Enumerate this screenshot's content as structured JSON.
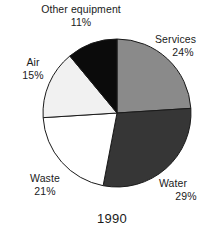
{
  "chart_data": {
    "type": "pie",
    "title": "1990",
    "xlabel": "",
    "ylabel": "",
    "legend_position": "none",
    "grid": false,
    "start_angle_deg": 0,
    "direction": "clockwise",
    "categories": [
      "Services",
      "Water",
      "Waste",
      "Air",
      "Other equipment"
    ],
    "values": [
      24,
      29,
      21,
      15,
      11
    ],
    "value_unit": "%",
    "slices": [
      {
        "label": "Services",
        "value": 24,
        "value_text": "24%",
        "color": "#8a8a8a"
      },
      {
        "label": "Water",
        "value": 29,
        "value_text": "29%",
        "color": "#363636"
      },
      {
        "label": "Waste",
        "value": 21,
        "value_text": "21%",
        "color": "#ffffff"
      },
      {
        "label": "Air",
        "value": 15,
        "value_text": "15%",
        "color": "#f1f1f1"
      },
      {
        "label": "Other equipment",
        "value": 11,
        "value_text": "11%",
        "color": "#0b0b0b"
      }
    ],
    "outline_color": "#1a1a1a",
    "text_color": "#1a1a1a",
    "background_color": "#ffffff"
  },
  "labels": {
    "services": {
      "name": "Services",
      "pct": "24%"
    },
    "water": {
      "name": "Water",
      "pct": "29%"
    },
    "waste": {
      "name": "Waste",
      "pct": "21%"
    },
    "air": {
      "name": "Air",
      "pct": "15%"
    },
    "other": {
      "name": "Other equipment",
      "pct": "11%"
    }
  },
  "title": "1990"
}
